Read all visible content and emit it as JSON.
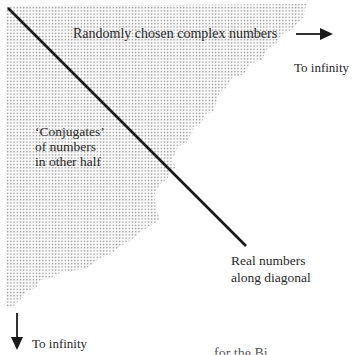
{
  "diagram": {
    "labels": {
      "top_region": "Randomly chosen complex numbers",
      "left_region_line1": "‘Conjugates’",
      "left_region_line2": "of numbers",
      "left_region_line3": "in other half",
      "diagonal_line1": "Real numbers",
      "diagonal_line2": "along diagonal",
      "right_arrow_label": "To infinity",
      "down_arrow_label": "To infinity",
      "cut_off_caption": "... for the Bi"
    },
    "icons": {
      "right_arrow": "arrow-right-icon",
      "down_arrow": "arrow-down-icon"
    },
    "colors": {
      "dots": "#8a8a8a",
      "line": "#1a1a1a",
      "background": "#ffffff"
    }
  }
}
